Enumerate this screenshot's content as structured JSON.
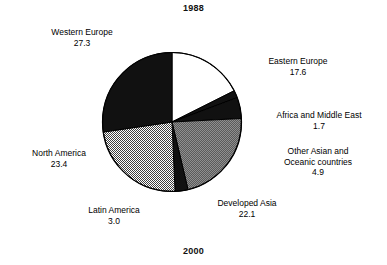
{
  "titles": {
    "top": "1988",
    "bottom": "2000"
  },
  "chart_data": {
    "type": "pie",
    "title": "1988",
    "subtitle": "2000",
    "total": 100.0,
    "units": "percent",
    "start_angle_deg": 0,
    "direction": "clockwise",
    "legend": "none",
    "grid": false,
    "categories": [
      "Eastern Europe",
      "Africa and Middle East",
      "Other Asian and Oceanic countries",
      "Developed Asia",
      "Latin America",
      "North America",
      "Western Europe"
    ],
    "values": [
      17.6,
      1.7,
      4.9,
      22.1,
      3.0,
      23.4,
      27.3
    ],
    "slices": [
      {
        "label_line1": "Eastern Europe",
        "label_line2": "",
        "value": "17.6",
        "value_num": 17.6,
        "fill": "white",
        "fill_color": "#ffffff"
      },
      {
        "label_line1": "Africa and Middle East",
        "label_line2": "",
        "value": "1.7",
        "value_num": 1.7,
        "fill": "black",
        "fill_color": "#111111"
      },
      {
        "label_line1": "Other Asian and",
        "label_line2": "Oceanic countries",
        "value": "4.9",
        "value_num": 4.9,
        "fill": "black",
        "fill_color": "#111111"
      },
      {
        "label_line1": "Developed Asia",
        "label_line2": "",
        "value": "22.1",
        "value_num": 22.1,
        "fill": "medium-gray-halftone",
        "fill_color": "#6f6f6f"
      },
      {
        "label_line1": "Latin America",
        "label_line2": "",
        "value": "3.0",
        "value_num": 3.0,
        "fill": "black",
        "fill_color": "#111111"
      },
      {
        "label_line1": "North America",
        "label_line2": "",
        "value": "23.4",
        "value_num": 23.4,
        "fill": "light-gray-halftone",
        "fill_color": "#b4b4b4"
      },
      {
        "label_line1": "Western Europe",
        "label_line2": "",
        "value": "27.3",
        "value_num": 27.3,
        "fill": "black",
        "fill_color": "#111111"
      }
    ]
  },
  "labels": {
    "western_europe": {
      "name": "Western Europe",
      "value": "27.3"
    },
    "eastern_europe": {
      "name": "Eastern Europe",
      "value": "17.6"
    },
    "africa_middle_east": {
      "name": "Africa and Middle East",
      "value": "1.7"
    },
    "other_asian": {
      "name": "Other Asian and",
      "name2": "Oceanic countries",
      "value": "4.9"
    },
    "north_america": {
      "name": "North America",
      "value": "23.4"
    },
    "latin_america": {
      "name": "Latin America",
      "value": "3.0"
    },
    "developed_asia": {
      "name": "Developed Asia",
      "value": "22.1"
    }
  },
  "colors": {
    "black": "#111111",
    "white": "#ffffff",
    "light_gray": "#b4b4b4",
    "medium_gray": "#6f6f6f",
    "outline": "#000000",
    "text": "#000000"
  }
}
